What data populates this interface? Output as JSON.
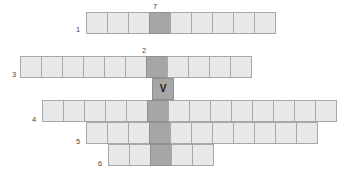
{
  "diagram": {
    "kind": "crossword-grid",
    "canvas": {
      "width": 361,
      "height": 186
    },
    "colors": {
      "cell_fill": "#e8e8e8",
      "cell_border": "#a8a8a8",
      "highlight_fill": "#a6a6a6",
      "highlight_border": "#8f8f8f",
      "background": "#ffffff",
      "label_text": "#4a4a4a",
      "letter_text": "#1a1a1a"
    },
    "cell_size": {
      "width": 22,
      "height": 22
    },
    "highlight_column_x": 152,
    "labels": [
      {
        "name": "label-7",
        "text": "7",
        "x": 153,
        "y": 3
      },
      {
        "name": "label-1",
        "text": "1",
        "x": 76,
        "y": 26
      },
      {
        "name": "label-2",
        "text": "2",
        "x": 142,
        "y": 47
      },
      {
        "name": "label-3",
        "text": "3",
        "x": 12,
        "y": 71
      },
      {
        "name": "label-4",
        "text": "4",
        "x": 32,
        "y": 116
      },
      {
        "name": "label-5",
        "text": "5",
        "x": 76,
        "y": 138
      },
      {
        "name": "label-6",
        "text": "6",
        "x": 98,
        "y": 160
      }
    ],
    "rows": [
      {
        "name": "row-1",
        "clue_number": "1",
        "y": 12,
        "x_start": 86,
        "cell_count": 9,
        "highlight_index": 3,
        "letters": [
          "",
          "",
          "",
          "",
          "",
          "",
          "",
          "",
          ""
        ]
      },
      {
        "name": "row-3",
        "clue_number": "3",
        "y": 56,
        "x_start": 20,
        "cell_count": 11,
        "highlight_index": 6,
        "letters": [
          "",
          "",
          "",
          "",
          "",
          "",
          "",
          "",
          "",
          "",
          ""
        ]
      },
      {
        "name": "row-v",
        "clue_number": "",
        "y": 78,
        "x_start": 152,
        "cell_count": 1,
        "highlight_index": 0,
        "letters": [
          "V"
        ]
      },
      {
        "name": "row-4",
        "clue_number": "4",
        "y": 100,
        "x_start": 42,
        "cell_count": 14,
        "highlight_index": 5,
        "letters": [
          "",
          "",
          "",
          "",
          "",
          "",
          "",
          "",
          "",
          "",
          "",
          "",
          "",
          ""
        ]
      },
      {
        "name": "row-5",
        "clue_number": "5",
        "y": 122,
        "x_start": 86,
        "cell_count": 11,
        "highlight_index": 3,
        "letters": [
          "",
          "",
          "",
          "",
          "",
          "",
          "",
          "",
          "",
          "",
          ""
        ]
      },
      {
        "name": "row-6",
        "clue_number": "6",
        "y": 144,
        "x_start": 108,
        "cell_count": 5,
        "highlight_index": 2,
        "letters": [
          "",
          "",
          "",
          "",
          ""
        ]
      }
    ],
    "vertical_segments": [
      {
        "name": "vertical-word-column",
        "x": 152,
        "y_start": 12,
        "y_end": 166
      }
    ]
  }
}
